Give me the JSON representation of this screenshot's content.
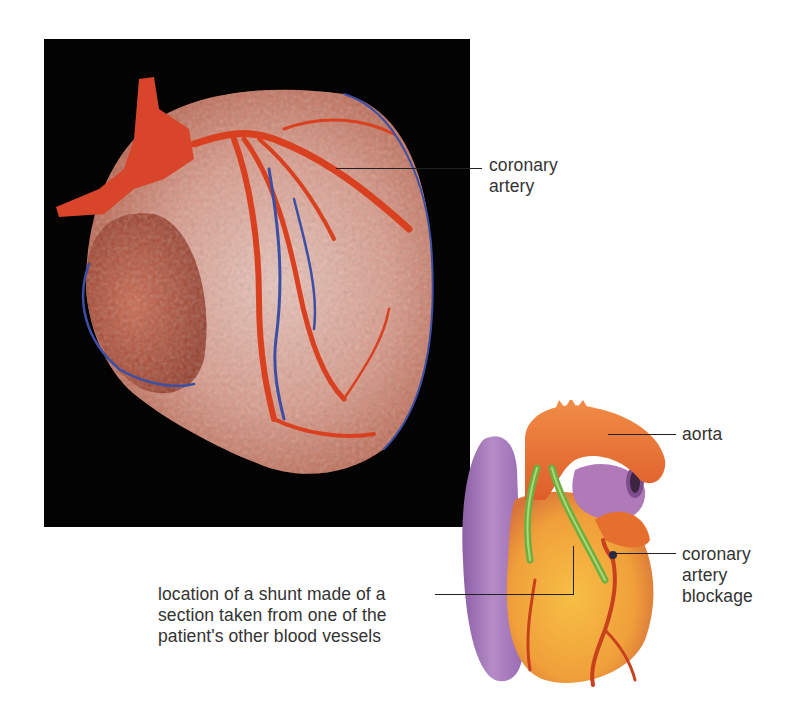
{
  "figure": {
    "photo": {
      "name": "corrosion cast photo of heart vasculature",
      "background": "#030303"
    },
    "illustration": {
      "name": "heart illustration with bypass shunts"
    },
    "labels": {
      "coronary_artery": [
        "coronary",
        "artery"
      ],
      "aorta": "aorta",
      "blockage": [
        "coronary",
        "artery",
        "blockage"
      ],
      "shunt": [
        "location of a shunt made of a",
        "section taken from one of the",
        "patient's other blood vessels"
      ]
    },
    "colors": {
      "artery": "#d9401f",
      "vein": "#3b4fa6",
      "tissue": "#e7b7a8",
      "aorta_illus": "#e8692f",
      "vena_illus": "#a779b8",
      "myocardium_illus": "#f2a93a",
      "shunt": "#7cc04a",
      "label_text": "#333333"
    }
  }
}
